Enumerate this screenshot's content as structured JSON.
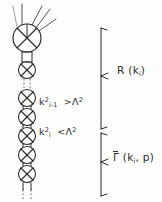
{
  "figure": {
    "kind": "feynman-ladder-diagram",
    "width": 162,
    "height": 202,
    "background_color": "#fdfdfc",
    "ink_color": "#2b2b2b"
  },
  "labels": {
    "cut_upper": {
      "momentum": "k",
      "momentum_sub": "i-1",
      "momentum_sup": "2",
      "relation": ">",
      "scale": "Λ",
      "scale_sup": "2",
      "full_text": "k²ᵢ₋₁ > Λ²"
    },
    "cut_lower": {
      "momentum": "k",
      "momentum_sub": "i",
      "momentum_sup": "2",
      "relation": "<",
      "scale": "Λ",
      "scale_sup": "2",
      "full_text": "k²ᵢ < Λ²"
    }
  },
  "brackets": {
    "upper": {
      "name": "R",
      "open_paren": "(",
      "arg": "k",
      "arg_sub": "i",
      "close_paren": ")",
      "full_text": "R (kᵢ)",
      "overline": false
    },
    "lower": {
      "name": "Γ",
      "open_paren": "(",
      "arg": "k",
      "arg_sub": "i",
      "arg2": ", p",
      "close_paren": ")",
      "full_text": "Γ̄ (kᵢ, p)",
      "overline": true
    }
  },
  "diagram": {
    "external_legs_count": 5,
    "top_blob": {
      "cx": 27,
      "cy": 38,
      "r": 14,
      "crossed": true
    },
    "chain_blobs": [
      {
        "cx": 27,
        "cy": 70,
        "r": 8.5,
        "crossed": true
      },
      {
        "cx": 27,
        "cy": 98,
        "r": 8.5,
        "crossed": true
      },
      {
        "cx": 27,
        "cy": 117,
        "r": 8.5,
        "crossed": true
      },
      {
        "cx": 27,
        "cy": 136,
        "r": 8.5,
        "crossed": true
      },
      {
        "cx": 27,
        "cy": 155,
        "r": 8.5,
        "crossed": true
      },
      {
        "cx": 27,
        "cy": 174,
        "r": 8.5,
        "crossed": true
      }
    ],
    "dotted_gaps": [
      {
        "x": 27,
        "y1": 79,
        "y2": 90
      },
      {
        "x": 27,
        "y1": 190,
        "y2": 200
      }
    ]
  }
}
